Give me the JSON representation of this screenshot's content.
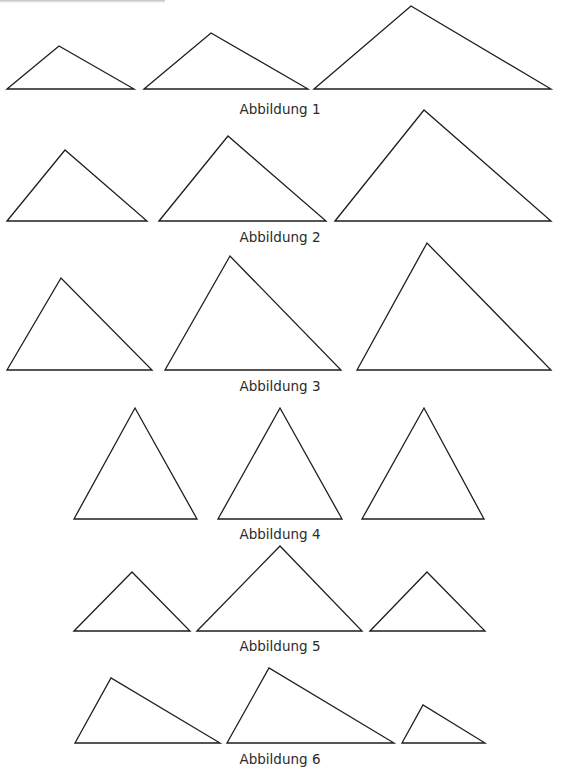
{
  "page": {
    "width": 561,
    "height": 775,
    "background": "#ffffff",
    "stroke_color": "#1e1e1e"
  },
  "figures": [
    {
      "label": "Abbildung 1",
      "label_pos": [
        280,
        101
      ],
      "triangles": [
        [
          [
            7,
            89
          ],
          [
            59,
            46
          ],
          [
            134,
            89
          ]
        ],
        [
          [
            144,
            89
          ],
          [
            211,
            33
          ],
          [
            308,
            89
          ]
        ],
        [
          [
            314,
            89
          ],
          [
            411,
            6
          ],
          [
            551,
            89
          ]
        ]
      ]
    },
    {
      "label": "Abbildung 2",
      "label_pos": [
        280,
        229
      ],
      "triangles": [
        [
          [
            7,
            221
          ],
          [
            65,
            150
          ],
          [
            147,
            221
          ]
        ],
        [
          [
            159,
            221
          ],
          [
            228,
            136
          ],
          [
            326,
            221
          ]
        ],
        [
          [
            335,
            221
          ],
          [
            424,
            110
          ],
          [
            551,
            221
          ]
        ]
      ]
    },
    {
      "label": "Abbildung 3",
      "label_pos": [
        280,
        378
      ],
      "triangles": [
        [
          [
            7,
            370
          ],
          [
            61,
            278
          ],
          [
            152,
            370
          ]
        ],
        [
          [
            165,
            370
          ],
          [
            230,
            256
          ],
          [
            341,
            370
          ]
        ],
        [
          [
            357,
            370
          ],
          [
            427,
            243
          ],
          [
            551,
            370
          ]
        ]
      ]
    },
    {
      "label": "Abbildung 4",
      "label_pos": [
        280,
        526
      ],
      "triangles": [
        [
          [
            74,
            519
          ],
          [
            135,
            408
          ],
          [
            197,
            519
          ]
        ],
        [
          [
            218,
            519
          ],
          [
            280,
            408
          ],
          [
            342,
            519
          ]
        ],
        [
          [
            362,
            519
          ],
          [
            424,
            408
          ],
          [
            484,
            519
          ]
        ]
      ]
    },
    {
      "label": "Abbildung 5",
      "label_pos": [
        280,
        638
      ],
      "triangles": [
        [
          [
            74,
            631
          ],
          [
            132,
            572
          ],
          [
            190,
            631
          ]
        ],
        [
          [
            197,
            631
          ],
          [
            280,
            546
          ],
          [
            362,
            631
          ]
        ],
        [
          [
            370,
            631
          ],
          [
            427,
            572
          ],
          [
            485,
            631
          ]
        ]
      ]
    },
    {
      "label": "Abbildung 6",
      "label_pos": [
        280,
        751
      ],
      "triangles": [
        [
          [
            75,
            743
          ],
          [
            111,
            678
          ],
          [
            220,
            743
          ]
        ],
        [
          [
            227,
            743
          ],
          [
            269,
            668
          ],
          [
            394,
            743
          ]
        ],
        [
          [
            402,
            743
          ],
          [
            423,
            705
          ],
          [
            485,
            743
          ]
        ]
      ]
    }
  ]
}
